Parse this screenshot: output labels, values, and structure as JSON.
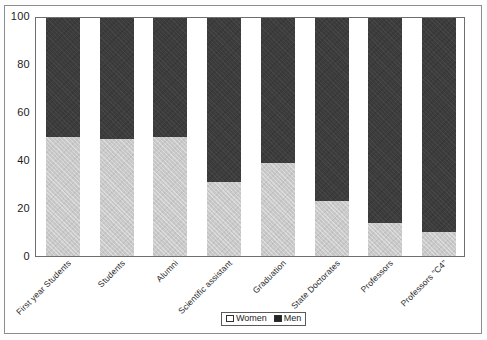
{
  "chart_data": {
    "type": "bar",
    "subtype": "stacked-percentage",
    "title": "",
    "xlabel": "",
    "ylabel": "",
    "ylim": [
      0,
      100
    ],
    "yticks": [
      0,
      20,
      40,
      60,
      80,
      100
    ],
    "grid": false,
    "legend_position": "bottom-center",
    "categories": [
      "First year Students",
      "Students",
      "Alumni",
      "Scientific assistant",
      "Graduation",
      "State Doctorates",
      "Professors",
      "Professors \"C4\""
    ],
    "series": [
      {
        "name": "Women",
        "color": "#c9c9c9",
        "values": [
          50,
          49,
          50,
          31,
          39,
          23,
          14,
          10
        ]
      },
      {
        "name": "Men",
        "color": "#3c3c3c",
        "values": [
          50,
          51,
          50,
          69,
          61,
          77,
          86,
          90
        ]
      }
    ]
  },
  "legend": {
    "items": [
      {
        "label": "Women",
        "swatch": "women-swatch-icon"
      },
      {
        "label": "Men",
        "swatch": "men-swatch-icon"
      }
    ]
  },
  "axis": {
    "y_tick_labels": [
      "100",
      "80",
      "60",
      "40",
      "20",
      "0"
    ]
  }
}
